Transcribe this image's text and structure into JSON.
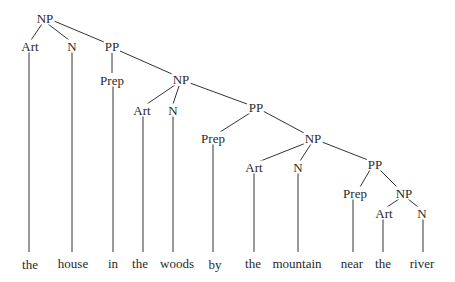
{
  "diagram": {
    "type": "syntax-tree",
    "nodes": {
      "np1": {
        "label": "NP"
      },
      "art1": {
        "label": "Art"
      },
      "n1": {
        "label": "N"
      },
      "pp1": {
        "label": "PP"
      },
      "prep1": {
        "label": "Prep"
      },
      "np2": {
        "label": "NP"
      },
      "art2": {
        "label": "Art"
      },
      "n2": {
        "label": "N"
      },
      "pp2": {
        "label": "PP"
      },
      "prep2": {
        "label": "Prep"
      },
      "np3": {
        "label": "NP"
      },
      "art3": {
        "label": "Art"
      },
      "n3": {
        "label": "N"
      },
      "pp3": {
        "label": "PP"
      },
      "prep3": {
        "label": "Prep"
      },
      "np4": {
        "label": "NP"
      },
      "art4": {
        "label": "Art"
      },
      "n4": {
        "label": "N"
      }
    },
    "words": [
      "the",
      "house",
      "in",
      "the",
      "woods",
      "by",
      "the",
      "mountain",
      "near",
      "the",
      "river"
    ]
  }
}
